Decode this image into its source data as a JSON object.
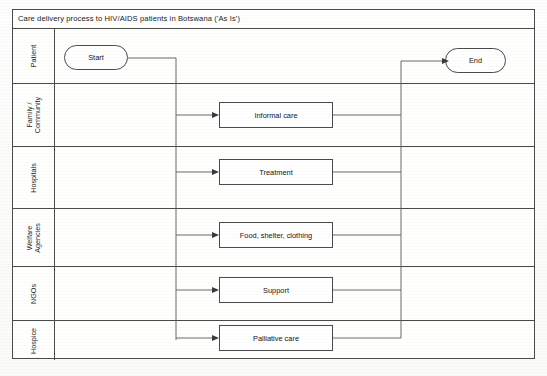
{
  "diagram": {
    "title": "Care delivery process to HIV/AIDS patients in Botswana ('As Is')",
    "type": "swimlane-flowchart",
    "colors": {
      "line": "#4a4a4a",
      "connector": "#5a5a5a",
      "background": "#ffffff",
      "text": "#141414"
    },
    "lanes": [
      {
        "label": "Patient",
        "node": "Start",
        "node_type": "terminator"
      },
      {
        "label": "Family /\nCommunity",
        "label_line1": "Family /",
        "label_line2": "Community",
        "node": "Informal care",
        "node_type": "process"
      },
      {
        "label": "Hospitals",
        "node": "Treatment",
        "node_type": "process"
      },
      {
        "label": "Welfare\nAgencies",
        "label_line1": "Welfare",
        "label_line2": "Agencies",
        "node": "Food, shelter, clothing",
        "node_type": "process"
      },
      {
        "label": "NGOs",
        "node": "Support",
        "node_type": "process"
      },
      {
        "label": "Hospice",
        "node": "Palliative care",
        "node_type": "process"
      }
    ],
    "terminators": {
      "start": "Start",
      "end": "End"
    },
    "processes": [
      "Informal care",
      "Treatment",
      "Food, shelter, clothing",
      "Support",
      "Palliative care"
    ]
  }
}
